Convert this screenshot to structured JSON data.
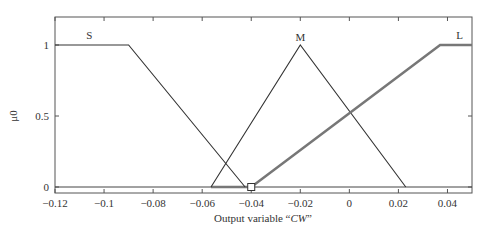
{
  "chart_data": {
    "type": "line",
    "title": "",
    "xlabel_prefix": "Output variable “",
    "xlabel_var": "CW",
    "xlabel_suffix": "”",
    "ylabel": "μ0",
    "xlim": [
      -0.12,
      0.05
    ],
    "ylim": [
      0,
      1.2
    ],
    "grid": false,
    "x_ticks": [
      -0.12,
      -0.1,
      -0.08,
      -0.06,
      -0.04,
      -0.02,
      0,
      0.02,
      0.04
    ],
    "x_tick_labels": [
      "−0.12",
      "−0.1",
      "−0.08",
      "−0.06",
      "−0.04",
      "−0.02",
      "0",
      "0.02",
      "0.04"
    ],
    "y_ticks": [
      0,
      0.5,
      1
    ],
    "y_tick_labels": [
      "0",
      "0.5",
      "1"
    ],
    "series": [
      {
        "name": "S",
        "shape": "trapezoid",
        "x": [
          -0.12,
          -0.09,
          -0.0425
        ],
        "y": [
          1,
          1,
          0
        ],
        "color": "#333333",
        "highlighted": false
      },
      {
        "name": "M",
        "shape": "triangle",
        "x": [
          -0.0564,
          -0.02,
          0.023
        ],
        "y": [
          0,
          1,
          0
        ],
        "color": "#333333",
        "highlighted": false
      },
      {
        "name": "L",
        "shape": "trapezoid",
        "x": [
          -0.04,
          0.037,
          0.05
        ],
        "y": [
          0,
          1,
          1
        ],
        "color": "#777777",
        "highlighted": true
      }
    ],
    "aggregate_baseline": {
      "x": [
        -0.0564,
        -0.04
      ],
      "y": [
        0,
        0
      ],
      "color": "#777777"
    },
    "marker": {
      "x": -0.04,
      "y": 0,
      "shape": "square"
    }
  }
}
